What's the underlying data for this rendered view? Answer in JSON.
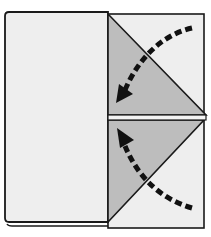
{
  "diagram": {
    "type": "origami-fold-step",
    "description": "Fold the top and bottom right corners inward toward the center vertical edge",
    "colors": {
      "paper": "#eeeeee",
      "folded_flap": "#bdbdbd",
      "outline": "#1a1a1a",
      "arrow": "#111111",
      "background": "#ffffff"
    },
    "elements": {
      "left_panel": "front layer of paper",
      "right_back": "back layer square",
      "top_flap": "upper triangular flap",
      "bottom_flap": "lower triangular flap",
      "top_arrow": "dashed curved fold arrow pointing down-left",
      "bottom_arrow": "dashed curved fold arrow pointing up-left"
    }
  }
}
